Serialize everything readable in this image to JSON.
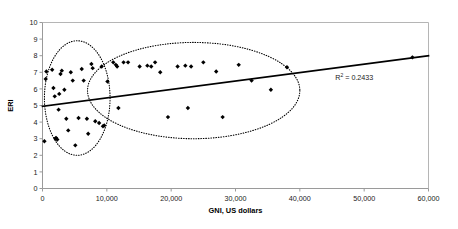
{
  "chart_data": {
    "type": "scatter",
    "title": "",
    "xlabel": "GNI, US dollars",
    "ylabel": "ERI",
    "xlim": [
      0,
      60000
    ],
    "ylim": [
      0,
      10
    ],
    "xticks": [
      0,
      10000,
      20000,
      30000,
      40000,
      50000,
      60000
    ],
    "xtick_labels": [
      "0",
      "10,000",
      "20,000",
      "30,000",
      "40,000",
      "50,000",
      "60,000"
    ],
    "yticks": [
      0,
      1,
      2,
      3,
      4,
      5,
      6,
      7,
      8,
      9,
      10
    ],
    "ytick_labels": [
      "0",
      "1",
      "2",
      "3",
      "4",
      "5",
      "6",
      "7",
      "8",
      "9",
      "10"
    ],
    "grid": false,
    "legend": "none",
    "marker": "diamond",
    "marker_color": "#000000",
    "annotations": [
      {
        "name": "r-squared-label",
        "text": "R2 = 0.2433",
        "text_main": " = 0.2433",
        "text_base": "R",
        "text_sup": "2",
        "x": 45500,
        "y": 6.55
      }
    ],
    "trendline": {
      "name": "linear-trendline",
      "type": "linear",
      "x_start": 0,
      "y_start": 4.95,
      "x_end": 60000,
      "y_end": 8.0,
      "r_squared": 0.2433
    },
    "highlight_regions": [
      {
        "name": "low-income-cluster-ellipse",
        "shape": "ellipse",
        "cx": 5400,
        "cy": 5.45,
        "rx": 5100,
        "ry": 3.45,
        "style": "dotted"
      },
      {
        "name": "higher-income-cluster-ellipse",
        "shape": "ellipse",
        "cx": 23500,
        "cy": 5.9,
        "rx": 16500,
        "ry": 2.9,
        "style": "dotted"
      }
    ],
    "points": [
      {
        "x": 500,
        "y": 6.6
      },
      {
        "x": 600,
        "y": 7.05
      },
      {
        "x": 300,
        "y": 2.85
      },
      {
        "x": 1500,
        "y": 7.15
      },
      {
        "x": 1700,
        "y": 6.05
      },
      {
        "x": 1900,
        "y": 5.55
      },
      {
        "x": 2000,
        "y": 3.0
      },
      {
        "x": 2100,
        "y": 3.05
      },
      {
        "x": 2300,
        "y": 2.95
      },
      {
        "x": 2500,
        "y": 4.75
      },
      {
        "x": 2600,
        "y": 5.7
      },
      {
        "x": 2800,
        "y": 6.9
      },
      {
        "x": 3000,
        "y": 7.1
      },
      {
        "x": 3400,
        "y": 5.95
      },
      {
        "x": 3700,
        "y": 4.2
      },
      {
        "x": 4000,
        "y": 3.5
      },
      {
        "x": 4400,
        "y": 7.0
      },
      {
        "x": 4700,
        "y": 6.5
      },
      {
        "x": 5100,
        "y": 2.6
      },
      {
        "x": 5600,
        "y": 4.25
      },
      {
        "x": 6100,
        "y": 7.2
      },
      {
        "x": 6400,
        "y": 6.5
      },
      {
        "x": 6900,
        "y": 4.2
      },
      {
        "x": 7100,
        "y": 3.3
      },
      {
        "x": 7600,
        "y": 7.5
      },
      {
        "x": 7800,
        "y": 7.25
      },
      {
        "x": 8200,
        "y": 4.05
      },
      {
        "x": 8800,
        "y": 3.95
      },
      {
        "x": 9200,
        "y": 7.35
      },
      {
        "x": 9400,
        "y": 3.75
      },
      {
        "x": 9600,
        "y": 3.8
      },
      {
        "x": 10100,
        "y": 6.45
      },
      {
        "x": 11000,
        "y": 7.6
      },
      {
        "x": 11400,
        "y": 7.45
      },
      {
        "x": 11600,
        "y": 7.35
      },
      {
        "x": 11800,
        "y": 4.85
      },
      {
        "x": 12600,
        "y": 7.6
      },
      {
        "x": 13300,
        "y": 7.6
      },
      {
        "x": 15100,
        "y": 7.35
      },
      {
        "x": 16300,
        "y": 7.4
      },
      {
        "x": 16900,
        "y": 7.35
      },
      {
        "x": 17500,
        "y": 7.6
      },
      {
        "x": 18300,
        "y": 7.0
      },
      {
        "x": 19500,
        "y": 4.3
      },
      {
        "x": 21000,
        "y": 7.35
      },
      {
        "x": 22200,
        "y": 7.4
      },
      {
        "x": 22600,
        "y": 4.85
      },
      {
        "x": 23100,
        "y": 7.35
      },
      {
        "x": 25000,
        "y": 7.6
      },
      {
        "x": 27000,
        "y": 7.05
      },
      {
        "x": 28000,
        "y": 4.3
      },
      {
        "x": 30500,
        "y": 7.45
      },
      {
        "x": 32500,
        "y": 6.5
      },
      {
        "x": 35500,
        "y": 5.95
      },
      {
        "x": 38000,
        "y": 7.3
      },
      {
        "x": 57500,
        "y": 7.9
      }
    ]
  }
}
